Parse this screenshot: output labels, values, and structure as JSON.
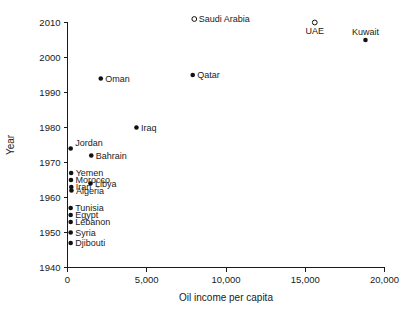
{
  "chart_data": {
    "type": "scatter",
    "title": "",
    "xlabel": "Oil income per capita",
    "ylabel": "Year",
    "xlim": [
      0,
      20000
    ],
    "ylim": [
      1940,
      2010
    ],
    "grid": false,
    "legend": null,
    "xticks": [
      {
        "value": 0,
        "label": "0"
      },
      {
        "value": 5000,
        "label": "5,000"
      },
      {
        "value": 10000,
        "label": "10,000"
      },
      {
        "value": 15000,
        "label": "15,000"
      },
      {
        "value": 20000,
        "label": "20,000"
      }
    ],
    "yticks": [
      {
        "value": 1940,
        "label": "1940"
      },
      {
        "value": 1950,
        "label": "1950"
      },
      {
        "value": 1960,
        "label": "1960"
      },
      {
        "value": 1970,
        "label": "1970"
      },
      {
        "value": 1980,
        "label": "1980"
      },
      {
        "value": 1990,
        "label": "1990"
      },
      {
        "value": 2000,
        "label": "2000"
      },
      {
        "value": 2010,
        "label": "2010"
      }
    ],
    "points": [
      {
        "label": "Saudi Arabia",
        "x": 8000,
        "y": 2011,
        "marker": "open",
        "label_pos": "right"
      },
      {
        "label": "UAE",
        "x": 15600,
        "y": 2010,
        "marker": "open",
        "label_pos": "below"
      },
      {
        "label": "Kuwait",
        "x": 18800,
        "y": 2005,
        "marker": "filled",
        "label_pos": "above"
      },
      {
        "label": "Qatar",
        "x": 7900,
        "y": 1995,
        "marker": "filled",
        "label_pos": "right"
      },
      {
        "label": "Oman",
        "x": 2100,
        "y": 1994,
        "marker": "filled",
        "label_pos": "right"
      },
      {
        "label": "Iraq",
        "x": 4350,
        "y": 1980,
        "marker": "filled",
        "label_pos": "right"
      },
      {
        "label": "Jordan",
        "x": 200,
        "y": 1974,
        "marker": "filled",
        "label_pos": "upper-right"
      },
      {
        "label": "Bahrain",
        "x": 1500,
        "y": 1972,
        "marker": "filled",
        "label_pos": "right"
      },
      {
        "label": "Yemen",
        "x": 230,
        "y": 1967,
        "marker": "filled",
        "label_pos": "right"
      },
      {
        "label": "Morocco",
        "x": 220,
        "y": 1965,
        "marker": "filled",
        "label_pos": "right"
      },
      {
        "label": "Libya",
        "x": 1450,
        "y": 1964,
        "marker": "filled",
        "label_pos": "right"
      },
      {
        "label": "Iran",
        "x": 240,
        "y": 1963,
        "marker": "filled",
        "label_pos": "right"
      },
      {
        "label": "Algeria",
        "x": 250,
        "y": 1962,
        "marker": "filled",
        "label_pos": "right"
      },
      {
        "label": "Tunisia",
        "x": 200,
        "y": 1957,
        "marker": "filled",
        "label_pos": "right"
      },
      {
        "label": "Egypt",
        "x": 200,
        "y": 1955,
        "marker": "filled",
        "label_pos": "right"
      },
      {
        "label": "Lebanon",
        "x": 200,
        "y": 1953,
        "marker": "filled",
        "label_pos": "right"
      },
      {
        "label": "Syria",
        "x": 200,
        "y": 1950,
        "marker": "filled",
        "label_pos": "right"
      },
      {
        "label": "Djibouti",
        "x": 200,
        "y": 1947,
        "marker": "filled",
        "label_pos": "right"
      }
    ]
  }
}
